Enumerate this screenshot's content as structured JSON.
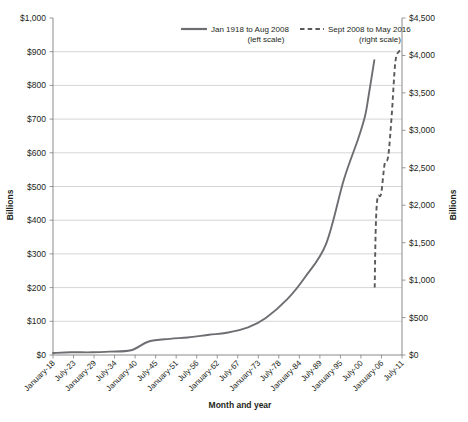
{
  "chart_data": {
    "type": "line",
    "title": "",
    "xlabel": "Month and year",
    "ylabel": "Billions",
    "ylabel_right": "Billions",
    "ylim": [
      0,
      1000
    ],
    "ylim_right": [
      0,
      4500
    ],
    "ytick_labels": [
      "$1,000",
      "$900",
      "$800",
      "$700",
      "$600",
      "$500",
      "$400",
      "$300",
      "$200",
      "$100",
      "$0"
    ],
    "ytick_values": [
      1000,
      900,
      800,
      700,
      600,
      500,
      400,
      300,
      200,
      100,
      0
    ],
    "ytick_labels_right": [
      "$4,500",
      "$4,000",
      "$3,500",
      "$3,000",
      "$2,500",
      "$2,000",
      "$1,500",
      "$1,000",
      "$500",
      "$0"
    ],
    "ytick_values_right": [
      4500,
      4000,
      3500,
      3000,
      2500,
      2000,
      1500,
      1000,
      500,
      0
    ],
    "grid": true,
    "legend_position": "top-center",
    "categories": [
      "January-18",
      "July-23",
      "January-29",
      "July-34",
      "January-40",
      "July-45",
      "January-51",
      "July-56",
      "January-62",
      "July-67",
      "January-73",
      "July-78",
      "January-84",
      "July-89",
      "January-95",
      "July-00",
      "January-06",
      "July-11"
    ],
    "series": [
      {
        "name": "Jan 1918 to Aug 2008",
        "scale": "left",
        "style": "solid",
        "color": "#6d6e71",
        "x": [
          1918,
          1923,
          1929,
          1934,
          1940,
          1945,
          1951,
          1956,
          1962,
          1967,
          1973,
          1978,
          1984,
          1989,
          1995,
          2000,
          2004,
          2006,
          2007,
          2008.6
        ],
        "values": [
          6,
          8,
          8,
          10,
          14,
          40,
          48,
          52,
          60,
          66,
          82,
          110,
          165,
          230,
          330,
          520,
          640,
          710,
          770,
          875
        ]
      },
      {
        "name": "Sept 2008 to May 2016",
        "scale": "right",
        "style": "dashed",
        "color": "#58595b",
        "x": [
          2008.7,
          2009.0,
          2009.5,
          2010.5,
          2011.5,
          2012.5,
          2013.5,
          2014.5,
          2015.5,
          2016.4
        ],
        "values": [
          900,
          1700,
          2100,
          2150,
          2550,
          2650,
          3200,
          3900,
          4050,
          4060
        ]
      }
    ],
    "legend": [
      {
        "label_line1": "Jan 1918 to Aug 2008",
        "label_line2": "(left scale)",
        "style": "solid"
      },
      {
        "label_line1": "Sept 2008 to May 2016",
        "label_line2": "(right scale)",
        "style": "dashed"
      }
    ]
  }
}
